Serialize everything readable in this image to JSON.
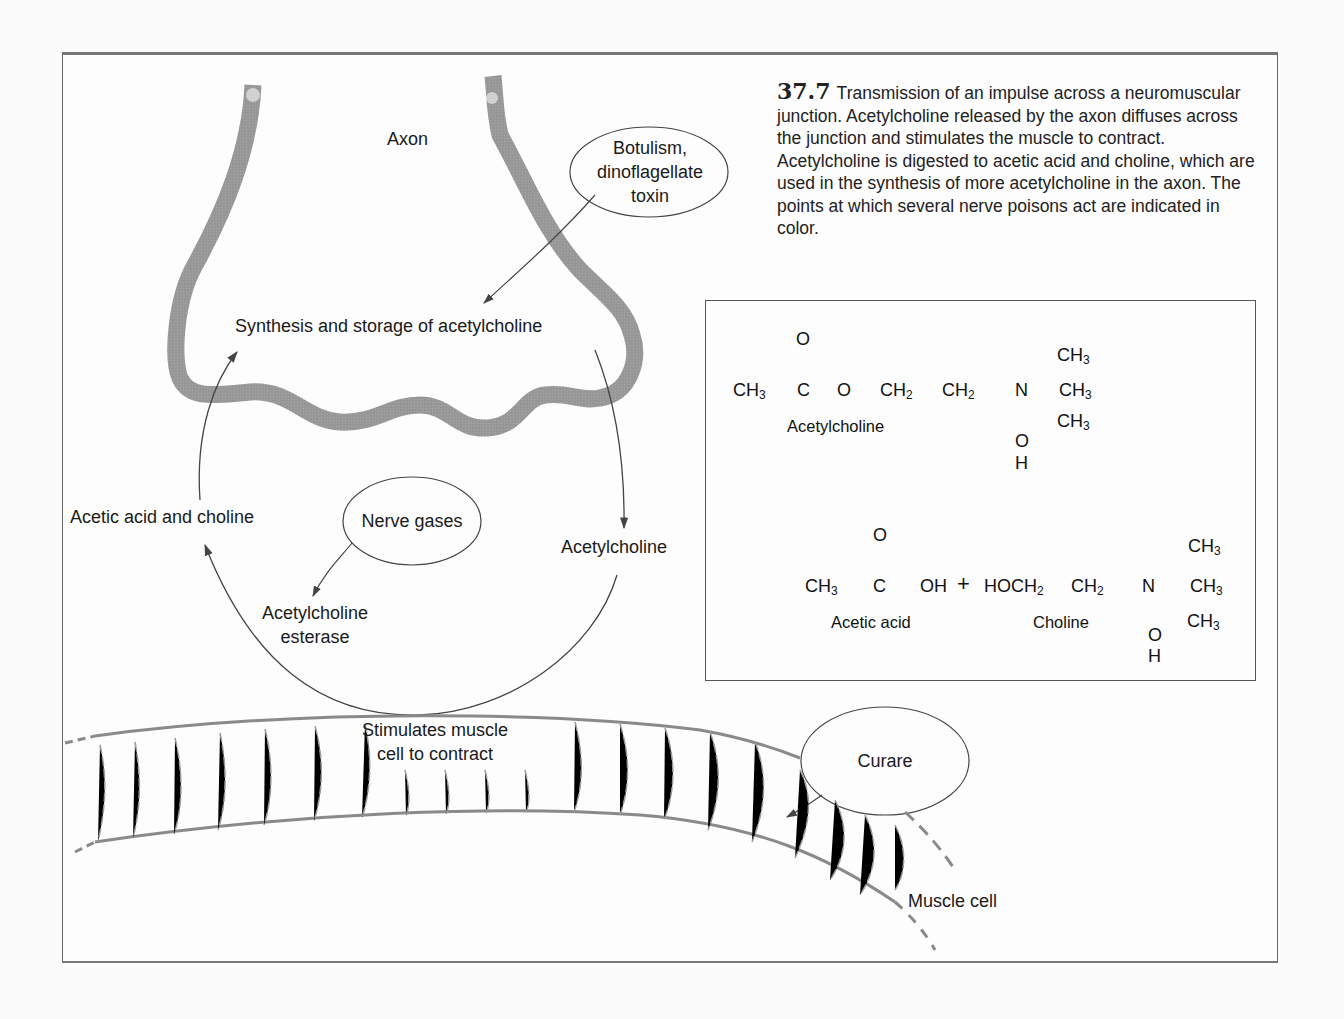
{
  "figure": {
    "number": "37.7",
    "caption": "Transmission of an impulse across a neuromuscular junction. Acetylcholine released by the axon diffuses across the junction and stimulates the muscle to contract. Acetylcholine is digested to acetic acid and choline, which are used in the synthesis of more acetylcholine in the axon. The points at which several nerve poisons act are indicated in color."
  },
  "diagram": {
    "labels": {
      "axon": "Axon",
      "synthesis": "Synthesis and storage of acetylcholine",
      "acetic_choline": "Acetic acid and choline",
      "acetylcholine": "Acetylcholine",
      "esterase_line1": "Acetylcholine",
      "esterase_line2": "esterase",
      "stimulates_line1": "Stimulates muscle",
      "stimulates_line2": "cell to contract",
      "muscle_cell": "Muscle cell"
    },
    "poisons": {
      "botulism_line1": "Botulism,",
      "botulism_line2": "dinoflagellate",
      "botulism_line3": "toxin",
      "nerve_gases": "Nerve gases",
      "curare": "Curare"
    }
  },
  "chemistry": {
    "acetylcholine": {
      "name": "Acetylcholine",
      "carbonyl_o": "O",
      "ch3": "CH",
      "c": "C",
      "o": "O",
      "ch2a": "CH",
      "ch2b": "CH",
      "n": "N",
      "oh_o": "O",
      "oh_h": "H",
      "methyl": "CH"
    },
    "products": {
      "acetic_acid_name": "Acetic acid",
      "choline_name": "Choline",
      "carbonyl_o": "O",
      "ch3": "CH",
      "c": "C",
      "oh": "OH",
      "plus": "+",
      "hoch2": "HOCH",
      "ch2": "CH",
      "n": "N",
      "oh_o": "O",
      "oh_h": "H",
      "methyl": "CH"
    },
    "subscripts": {
      "three": "3",
      "two": "2"
    }
  }
}
